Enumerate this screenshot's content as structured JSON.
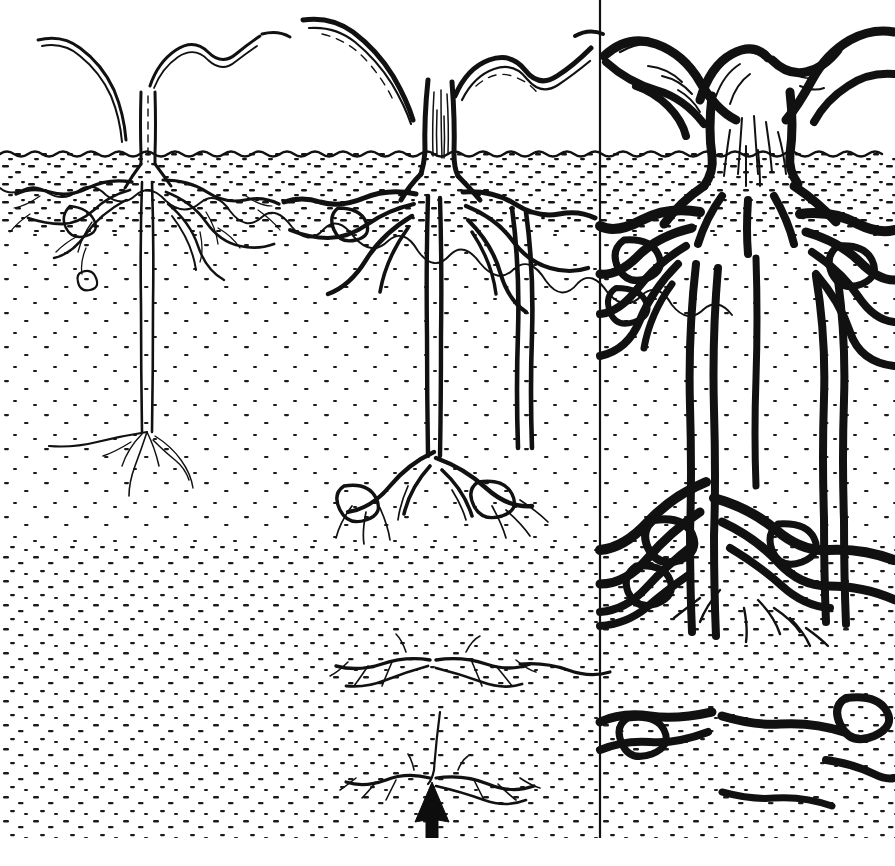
{
  "figure": {
    "medium": "black ink line drawing",
    "background_color": "#ffffff",
    "ink_color": "#111111",
    "width": 895,
    "height": 866,
    "caption": ""
  },
  "arrow": {
    "name": "annotation-arrow",
    "direction": "up",
    "color": "#0d0d0d",
    "tip_x": 432,
    "tip_y": 782,
    "tail_y": 852,
    "shaft_width": 13,
    "head_width": 34,
    "head_height": 40,
    "points_to": "deep horizontal root mat"
  },
  "ground": {
    "surface_y": 153,
    "surface_label": "soil surface",
    "topsoil": {
      "label": "topsoil",
      "top_y": 153,
      "bottom_y": 232,
      "texture": "dense dashes"
    },
    "subsoil": {
      "label": "subsoil",
      "top_y": 232,
      "bottom_y": 545,
      "texture": "sparse dots"
    },
    "deep_layer": {
      "label": "deep soil",
      "top_y": 545,
      "bottom_y": 838,
      "texture": "medium dashes"
    },
    "bottom_margin_y": 838
  },
  "panels": [
    {
      "id": "panel-seedling",
      "label": "stage 1 - seedling",
      "x0": 0,
      "x1": 300,
      "trunk_x": 148,
      "trunk_width_top": 7,
      "trunk_width_base": 13,
      "taproot_depth": 432,
      "lateral_spread": 150,
      "root_weight": "fine",
      "divider_right": false
    },
    {
      "id": "panel-sapling",
      "label": "stage 2 - sapling",
      "x0": 300,
      "x1": 600,
      "trunk_x": 440,
      "trunk_width_top": 13,
      "trunk_width_base": 34,
      "taproot_depth": 782,
      "lateral_spread": 290,
      "root_weight": "medium",
      "divider_right": true
    },
    {
      "id": "panel-mature",
      "label": "stage 3 - mature tree",
      "x0": 600,
      "x1": 895,
      "trunk_x": 748,
      "trunk_width_top": 40,
      "trunk_width_base": 96,
      "taproot_depth": 838,
      "lateral_spread": 295,
      "root_weight": "heavy",
      "divider_right": false
    }
  ],
  "divider": {
    "name": "panel-divider",
    "x": 600,
    "top_y": 0,
    "bottom_y": 838,
    "color": "#111111",
    "width": 2
  }
}
